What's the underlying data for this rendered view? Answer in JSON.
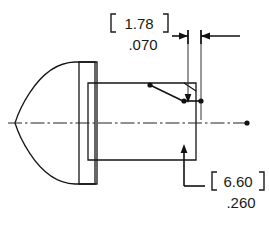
{
  "drawing": {
    "title": "Projectile nose section dimensioned drawing",
    "view": "side-section",
    "units": {
      "primary": "inch",
      "secondary": "millimeter",
      "secondary_style": "bracketed"
    },
    "colors": {
      "line": "#151515",
      "text": "#1a1a1a",
      "fill_light": "#f2f2f2",
      "fill_mid": "#c9c9c9",
      "fill_dark": "#9a9a9a",
      "background": "#ffffff"
    },
    "dimensions": [
      {
        "id": "chamfer-width",
        "metric_value": "1.78",
        "metric_open_bracket": "[",
        "metric_close_bracket": "]",
        "inch_value": ".070",
        "position": "top",
        "arrow_style": "outside-pointing-in"
      },
      {
        "id": "body-feature",
        "metric_value": "6.60",
        "metric_open_bracket": "[",
        "metric_close_bracket": "]",
        "inch_value": ".260",
        "position": "bottom-right",
        "arrow_style": "leader-with-arrow"
      }
    ],
    "parts": [
      {
        "id": "ogive-nose",
        "shape": "pointed-ogive",
        "label": "nose"
      },
      {
        "id": "flange-collar",
        "shape": "rectangle",
        "label": "flange"
      },
      {
        "id": "body-cylinder",
        "shape": "rectangle",
        "label": "body"
      },
      {
        "id": "chamfer-edge",
        "shape": "angled-corner",
        "label": "chamfer"
      }
    ],
    "centerline": {
      "id": "axis-centerline",
      "style": "dash-dot",
      "terminator": "dot"
    }
  }
}
